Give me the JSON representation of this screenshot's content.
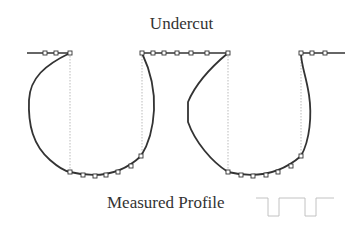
{
  "diagram": {
    "title": "Undercut",
    "caption": "Measured Profile",
    "colors": {
      "curve": "#333333",
      "guide": "#aaaaaa",
      "marker_fill": "#ffffff"
    },
    "top_line_y": 53,
    "bottom_y": 172,
    "top_markers": [
      45,
      56,
      70,
      142,
      153,
      164,
      177,
      191,
      207,
      228,
      301,
      312,
      325
    ],
    "bottom_markers_left": [
      [
        70,
        172
      ],
      [
        83,
        175
      ],
      [
        95,
        176
      ],
      [
        106,
        175
      ],
      [
        118,
        172
      ],
      [
        131,
        166
      ],
      [
        141,
        156
      ]
    ],
    "bottom_markers_right": [
      [
        228,
        172
      ],
      [
        241,
        175
      ],
      [
        253,
        176
      ],
      [
        266,
        175
      ],
      [
        278,
        172
      ],
      [
        291,
        166
      ],
      [
        301,
        156
      ]
    ],
    "icon": "measured-profile-thumbnail"
  }
}
